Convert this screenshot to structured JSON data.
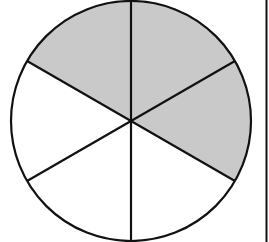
{
  "diagram": {
    "title": "",
    "type": "fraction-circle",
    "total_sectors": 6,
    "shaded_sectors": 3,
    "fraction_shaded": "3/6",
    "sectors": [
      {
        "index": 0,
        "position": "top-right",
        "shaded": true
      },
      {
        "index": 1,
        "position": "right",
        "shaded": true
      },
      {
        "index": 2,
        "position": "bottom-right",
        "shaded": false
      },
      {
        "index": 3,
        "position": "bottom-left",
        "shaded": false
      },
      {
        "index": 4,
        "position": "left",
        "shaded": false
      },
      {
        "index": 5,
        "position": "top-left",
        "shaded": true
      }
    ],
    "colors": {
      "shade": "#c9c9c9",
      "unshaded": "#ffffff",
      "stroke": "#111111"
    }
  }
}
